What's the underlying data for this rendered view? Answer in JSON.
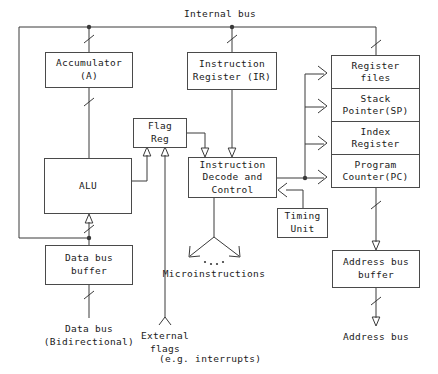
{
  "diagram": {
    "bus_label": "Internal bus",
    "blocks": {
      "accumulator": "Accumulator\n(A)",
      "instruction_register": "Instruction\nRegister (IR)",
      "flag_reg": "Flag\nReg",
      "alu": "ALU",
      "instruction_decode": "Instruction\nDecode and\nControl",
      "timing_unit": "Timing\nUnit",
      "data_bus_buffer": "Data bus\nbuffer",
      "address_bus_buffer": "Address bus\nbuffer"
    },
    "register_stack": [
      "Register\nfiles",
      "Stack\nPointer(SP)",
      "Index\nRegister",
      "Program\nCounter(PC)"
    ],
    "labels": {
      "microinstructions": "Microinstructions",
      "data_bus": "Data bus\n(Bidirectional)",
      "external_flags": "External\nflags",
      "external_flags_note": "(e.g. interrupts)",
      "address_bus": "Address bus"
    },
    "colors": {
      "line": "#3a3a3a",
      "box_border": "#4a4a4a",
      "text": "#1a1a1a",
      "background": "#ffffff"
    }
  }
}
